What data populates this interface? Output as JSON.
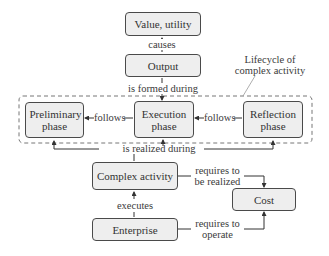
{
  "diagram": {
    "nodes": {
      "value": "Value, utility",
      "output": "Output",
      "preliminary": "Preliminary phase",
      "execution": "Execution phase",
      "reflection": "Reflection phase",
      "complex_activity": "Complex activity",
      "enterprise": "Enterprise",
      "cost": "Cost"
    },
    "group_label_line1": "Lifecycle of",
    "group_label_line2": "complex activity",
    "edges": {
      "causes": "causes",
      "formed": "is formed during",
      "follows_left": "follows",
      "follows_right": "follows",
      "realized": "is realized during",
      "executes": "executes",
      "req_realized_1": "requires to",
      "req_realized_2": "be realized",
      "req_operate_1": "requires to",
      "req_operate_2": "operate"
    },
    "colors": {
      "box_fill": "#eeeeee",
      "stroke": "#4a4a4a"
    }
  }
}
